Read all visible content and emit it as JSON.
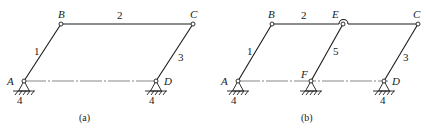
{
  "figure_a": {
    "caption": "(a)",
    "joints": {
      "A": "A",
      "B": "B",
      "C": "C",
      "D": "D"
    },
    "links": {
      "l1": "1",
      "l2": "2",
      "l3": "3"
    },
    "ground_labels": [
      "4",
      "4"
    ]
  },
  "figure_b": {
    "caption": "(b)",
    "joints": {
      "A": "A",
      "B": "B",
      "C": "C",
      "D": "D",
      "E": "E",
      "F": "F"
    },
    "links": {
      "l1": "1",
      "l2": "2",
      "l3": "3",
      "l5": "5"
    },
    "ground_labels": [
      "4",
      "4"
    ]
  }
}
